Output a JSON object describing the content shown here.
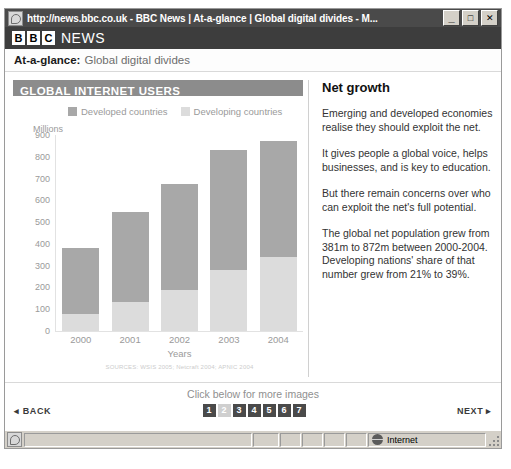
{
  "window": {
    "title": "http://news.bbc.co.uk - BBC News | At-a-glance | Global digital divides - M...",
    "icon": "page-icon",
    "minimize_label": "_",
    "maximize_label": "□",
    "close_label": "✕"
  },
  "masthead": {
    "blocks": [
      "B",
      "B",
      "C"
    ],
    "news_label": "NEWS"
  },
  "subhead": {
    "lead": "At-a-glance:",
    "rest": "Global digital divides"
  },
  "chart_data": {
    "type": "bar",
    "title": "GLOBAL INTERNET USERS",
    "xlabel": "Years",
    "ylabel": "Millions",
    "ylim": [
      0,
      900
    ],
    "yticks": [
      900,
      800,
      700,
      600,
      500,
      400,
      300,
      200,
      100,
      0
    ],
    "categories": [
      "2000",
      "2001",
      "2002",
      "2003",
      "2004"
    ],
    "stacked": true,
    "legend_position": "top",
    "grid": false,
    "series": [
      {
        "name": "Developed countries",
        "color": "#a8a8a8",
        "values": [
          301,
          412,
          487,
          551,
          532
        ]
      },
      {
        "name": "Developing countries",
        "color": "#dcdcdc",
        "values": [
          80,
          133,
          188,
          278,
          340
        ]
      }
    ],
    "totals": [
      381,
      545,
      675,
      829,
      872
    ],
    "source": "SOURCES: WSIS 2005; Netcraft 2004; APNIC 2004"
  },
  "side": {
    "title": "Net growth",
    "paragraphs": [
      "Emerging and developed economies realise they should exploit the net.",
      "It gives people a global voice, helps businesses, and is key to education.",
      "But there remain concerns over who can exploit the net's full potential.",
      "The global net population grew from 381m to 872m between 2000-2004. Developing nations' share of that number grew from 21% to 39%."
    ]
  },
  "footer": {
    "hint": "Click below for more images",
    "back_label": "◂ BACK",
    "next_label": "NEXT ▸",
    "pages": [
      "1",
      "2",
      "3",
      "4",
      "5",
      "6",
      "7"
    ],
    "current_page": "2"
  },
  "statusbar": {
    "zone_label": "Internet",
    "zone_icon": "globe-icon"
  }
}
